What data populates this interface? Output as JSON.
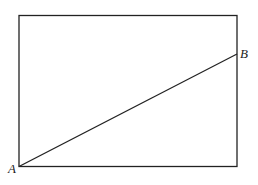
{
  "diagram": {
    "type": "geometry",
    "shape": "rectangle",
    "rectangle": {
      "x": 19,
      "y": 15,
      "width": 218,
      "height": 151
    },
    "segment": {
      "from": "A",
      "to": "B"
    },
    "points": [
      {
        "id": "A",
        "label": "A",
        "x": 19,
        "y": 166,
        "label_x": 8,
        "label_y": 163
      },
      {
        "id": "B",
        "label": "B",
        "x": 237,
        "y": 54,
        "label_x": 240,
        "label_y": 48
      }
    ],
    "stroke_color": "#222222"
  }
}
